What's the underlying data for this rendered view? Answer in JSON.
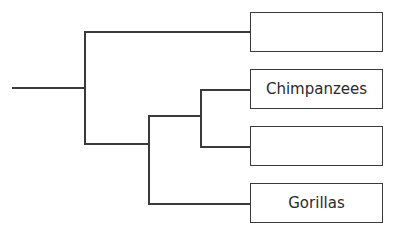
{
  "diagram": {
    "type": "phylogenetic-tree",
    "leaves": [
      {
        "label": ""
      },
      {
        "label": "Chimpanzees"
      },
      {
        "label": ""
      },
      {
        "label": "Gorillas"
      }
    ],
    "structure": "((leaf0), ((leaf1, leaf2), leaf3))",
    "line_color": "#3a3a3a"
  }
}
